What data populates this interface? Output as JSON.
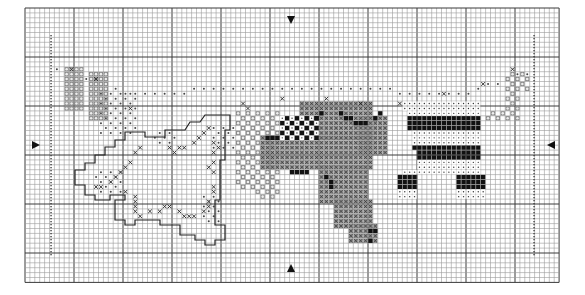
{
  "pattern": {
    "title": "Cross-stitch chart",
    "grid": {
      "left": 25,
      "top": 8,
      "cell": 4.9,
      "cols": 109,
      "rows": 56,
      "major_every": 10,
      "minor_color": "#9a9a9a",
      "major_color": "#3a3a3a"
    },
    "center_markers": {
      "top": {
        "x": 291,
        "y": 20,
        "direction": "down"
      },
      "bottom": {
        "x": 291,
        "y": 268,
        "direction": "up"
      },
      "left": {
        "x": 36,
        "y": 145,
        "direction": "right"
      },
      "right": {
        "x": 551,
        "y": 145,
        "direction": "left"
      }
    },
    "border_dotted_lines": [
      {
        "x": 51,
        "y1": 35,
        "y2": 255
      },
      {
        "x": 534,
        "y1": 35,
        "y2": 255
      }
    ],
    "motifs": [
      {
        "name": "left-garment-dots",
        "symbol": "dense-dot",
        "color": "#555555"
      },
      {
        "name": "outlined-shirt",
        "symbol": "outline-x",
        "color": "#222222"
      },
      {
        "name": "stippled-towel",
        "symbol": "light-dot",
        "color": "#777777"
      },
      {
        "name": "cross-hatched-shirt",
        "symbol": "x-fill",
        "color": "#6a6a6a"
      },
      {
        "name": "striped-dress",
        "symbol": "solid-block",
        "color": "#111111"
      },
      {
        "name": "right-garment-dots",
        "symbol": "dense-dot",
        "color": "#666666"
      }
    ],
    "symbol_legend": [
      {
        "symbol": "solid-block",
        "color": "#111111"
      },
      {
        "symbol": "x-fill",
        "color": "#5e5e5e"
      },
      {
        "symbol": "dense-dot",
        "color": "#555555"
      },
      {
        "symbol": "light-dot",
        "color": "#8a8a8a"
      },
      {
        "symbol": "open-square",
        "color": "#ffffff"
      }
    ]
  }
}
